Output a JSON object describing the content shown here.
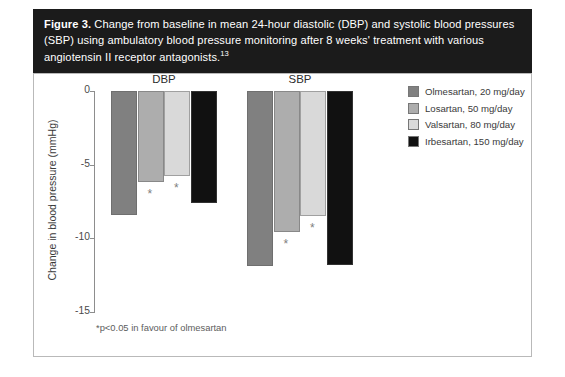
{
  "figure": {
    "label": "Figure 3.",
    "caption_text": " Change from baseline in mean 24-hour diastolic (DBP) and systolic blood pressures (SBP) using ambulatory blood pressure monitoring after 8 weeks' treatment with various angiotensin II receptor antagonists.",
    "reference": "13"
  },
  "footnote": "*p<0.05 in favour of olmesartan",
  "colors": {
    "olmesartan": "#808080",
    "losartan": "#adadad",
    "valsartan": "#d9d9d9",
    "irbesartan": "#111111",
    "caption_band": "#1b1b1b",
    "axis": "#8d8d8d",
    "panel_border": "#b9b9b9"
  },
  "legend": {
    "items": [
      {
        "label": "Olmesartan, 20 mg/day",
        "color": "#808080"
      },
      {
        "label": "Losartan, 50 mg/day",
        "color": "#adadad"
      },
      {
        "label": "Valsartan, 80 mg/day",
        "color": "#d9d9d9"
      },
      {
        "label": "Irbesartan, 150 mg/day",
        "color": "#111111"
      }
    ]
  },
  "chart_data": {
    "type": "bar",
    "title": "Change from baseline in mean 24-hour diastolic (DBP) and systolic blood pressures (SBP)",
    "xlabel": "",
    "ylabel": "Change in blood pressure (mmHg)",
    "ylim": [
      -15,
      0
    ],
    "yticks": [
      0,
      -5,
      -10,
      -15
    ],
    "ytick_labels": [
      "0",
      "-5",
      "-10",
      "-15"
    ],
    "grid": false,
    "legend_position": "right",
    "categories": [
      "DBP",
      "SBP"
    ],
    "series": [
      {
        "name": "Olmesartan, 20 mg/day",
        "color": "#808080",
        "values": [
          -8.4,
          -11.9
        ],
        "significant": [
          false,
          false
        ]
      },
      {
        "name": "Losartan, 50 mg/day",
        "color": "#adadad",
        "values": [
          -6.2,
          -9.6
        ],
        "significant": [
          true,
          true
        ]
      },
      {
        "name": "Valsartan, 80 mg/day",
        "color": "#d9d9d9",
        "values": [
          -5.8,
          -8.5
        ],
        "significant": [
          true,
          true
        ]
      },
      {
        "name": "Irbesartan, 150 mg/day",
        "color": "#111111",
        "values": [
          -7.6,
          -11.8
        ],
        "significant": [
          false,
          false
        ]
      }
    ],
    "annotation": "*p<0.05 in favour of olmesartan"
  }
}
